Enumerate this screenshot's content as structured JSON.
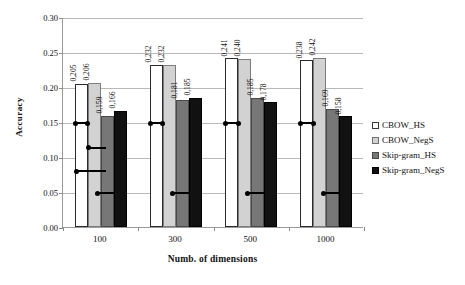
{
  "chart_data": {
    "type": "bar",
    "title": "",
    "xlabel": "Numb. of dimensions",
    "ylabel": "Accuracy",
    "categories": [
      "100",
      "300",
      "500",
      "1000"
    ],
    "ylim": [
      0.0,
      0.3
    ],
    "ytick_labels": [
      "0.00",
      "0.05",
      "0.10",
      "0.15",
      "0.20",
      "0.25",
      "0.30"
    ],
    "ytick_values": [
      0.0,
      0.05,
      0.1,
      0.15,
      0.2,
      0.25,
      0.3
    ],
    "grid": true,
    "legend_position": "right",
    "series": [
      {
        "name": "CBOW_HS",
        "color": "#ffffff",
        "values": [
          0.205,
          0.232,
          0.241,
          0.238
        ],
        "labels": [
          "0,205",
          "0,232",
          "0,241",
          "0,238"
        ]
      },
      {
        "name": "CBOW_NegS",
        "color": "#d2d2d2",
        "values": [
          0.206,
          0.232,
          0.24,
          0.242
        ],
        "labels": [
          "0,206",
          "0,232",
          "0,240",
          "0,242"
        ]
      },
      {
        "name": "Skip-gram_HS",
        "color": "#777777",
        "values": [
          0.159,
          0.181,
          0.185,
          0.169
        ],
        "labels": [
          "0,159",
          "0,181",
          "0,185",
          "0,169"
        ]
      },
      {
        "name": "Skip-gram_NegS",
        "color": "#111111",
        "values": [
          0.166,
          0.185,
          0.178,
          0.158
        ],
        "labels": [
          "0,166",
          "0,185",
          "0,178",
          "0,158"
        ]
      }
    ],
    "annotations": [
      {
        "group": "100",
        "y": 0.15,
        "x_start": 0.0,
        "x_end": 0.26
      },
      {
        "group": "100",
        "y": 0.115,
        "x_start": 0.26,
        "x_end": 0.6
      },
      {
        "group": "100",
        "y": 0.081,
        "x_start": 0.02,
        "x_end": 0.6
      },
      {
        "group": "100",
        "y": 0.05,
        "x_start": 0.43,
        "x_end": 0.75
      },
      {
        "group": "300",
        "y": 0.15,
        "x_start": 0.0,
        "x_end": 0.26
      },
      {
        "group": "300",
        "y": 0.05,
        "x_start": 0.43,
        "x_end": 0.75
      },
      {
        "group": "500",
        "y": 0.15,
        "x_start": 0.0,
        "x_end": 0.26
      },
      {
        "group": "500",
        "y": 0.05,
        "x_start": 0.43,
        "x_end": 0.75
      },
      {
        "group": "1000",
        "y": 0.15,
        "x_start": 0.0,
        "x_end": 0.26
      },
      {
        "group": "1000",
        "y": 0.05,
        "x_start": 0.43,
        "x_end": 0.75
      }
    ]
  }
}
